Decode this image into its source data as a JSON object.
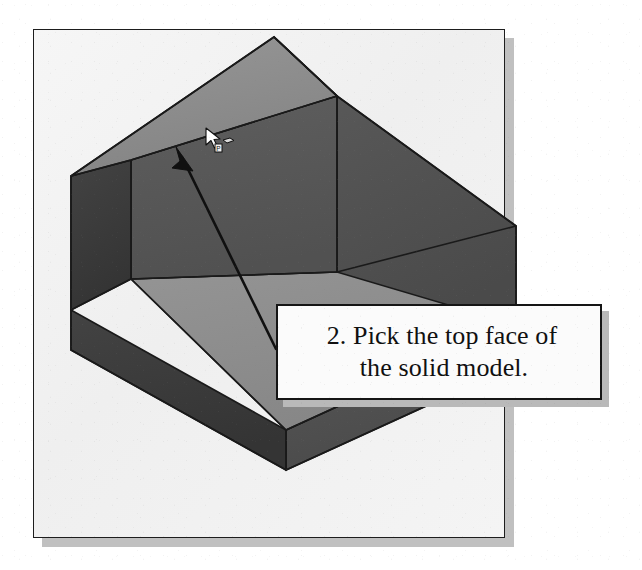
{
  "figure": {
    "type": "cad-illustration",
    "frame": {
      "border_color": "#1d1d1d",
      "fill_color": "#f3f3f3",
      "shadow_color": "#c0c0c0"
    }
  },
  "callout": {
    "line1": "2. Pick the top face of",
    "line2": "the solid model.",
    "step_number": "2",
    "border_color": "#151515",
    "fill_color": "#fbfbfb",
    "shadow_color": "#b9b9b9"
  },
  "pointer": {
    "arrow_name": "leader-arrow",
    "arrow_color": "#101010",
    "cursor_name": "arrow-pointer-with-face-select-badge",
    "cursor_fill": "#ffffff",
    "cursor_outline": "#101010"
  },
  "model": {
    "shape": "L-shaped block",
    "faces": [
      {
        "name": "top-face",
        "label": "top face",
        "color": "#8c8c8c"
      },
      {
        "name": "left-side-face",
        "label": "left side face",
        "color": "#3c3c3c"
      },
      {
        "name": "front-wall-face",
        "label": "front wall face",
        "color": "#585858"
      },
      {
        "name": "ledge-face",
        "label": "horizontal ledge",
        "color": "#8d8d8d"
      },
      {
        "name": "base-front-face",
        "label": "base front face",
        "color": "#3c3c3c"
      },
      {
        "name": "base-right-face",
        "label": "base right face",
        "color": "#555555"
      },
      {
        "name": "wall-right-face",
        "label": "wall right face",
        "color": "#4d4d4d"
      }
    ],
    "edge_color": "#1a1a1a"
  }
}
